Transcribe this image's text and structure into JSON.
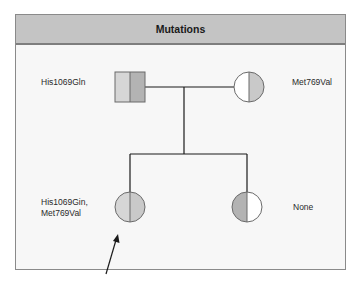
{
  "header": {
    "title": "Mutations"
  },
  "pedigree": {
    "father": {
      "sex": "male",
      "label": "His1069Gln",
      "left_fill": "#d6d6d6",
      "right_fill": "#b3b3b3"
    },
    "mother": {
      "sex": "female",
      "label": "Met769Val",
      "left_fill": "#ffffff",
      "right_fill": "#c9c9c9"
    },
    "children": [
      {
        "sex": "female",
        "label": "His1069Gin,\nMet769Val",
        "left_fill": "#d6d6d6",
        "right_fill": "#c9c9c9",
        "proband": true
      },
      {
        "sex": "female",
        "label": "None",
        "left_fill": "#b3b3b3",
        "right_fill": "#ffffff",
        "proband": false
      }
    ]
  },
  "colors": {
    "header_bg": "#c4c4c4",
    "frame_border": "#8a8a8a",
    "line": "#1a1a1a"
  }
}
